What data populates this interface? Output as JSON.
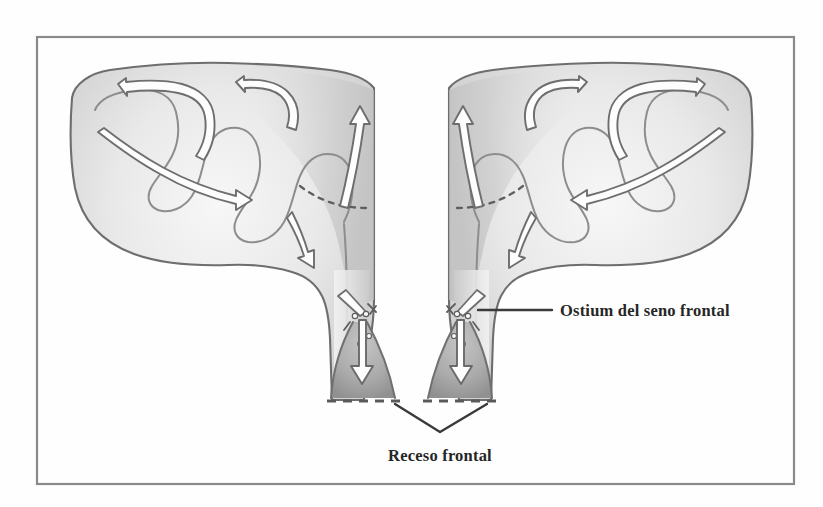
{
  "figure": {
    "kind": "anatomical-illustration",
    "style": "pencil-shaded line drawing",
    "language": "es",
    "frame": {
      "border_color": "#8a8a8a",
      "background_color": "#fefefe",
      "x": 36,
      "y": 36,
      "width": 759,
      "height": 449
    },
    "colors": {
      "outline": "#6e6e6e",
      "outline_soft": "#8d8d8d",
      "shade_light": "#ececec",
      "shade_mid": "#dcdcdc",
      "shade_dark": "#bdbdbd",
      "recess_fill": "#a9a9a9",
      "arrow_fill": "#fdfdfd",
      "text": "#262626",
      "leader": "#3a3a3a"
    },
    "labels": [
      {
        "id": "ostium",
        "text": "Ostium del seno frontal",
        "x": 560,
        "y": 316,
        "anchor": "start",
        "leader": {
          "type": "line",
          "from_x": 478,
          "from_y": 310,
          "to_x": 552,
          "to_y": 310
        }
      },
      {
        "id": "receso",
        "text": "Receso frontal",
        "x": 440,
        "y": 461,
        "anchor": "middle",
        "leader": {
          "type": "vee",
          "apex_x": 440,
          "apex_y": 432,
          "left_x": 395,
          "left_y": 404,
          "right_x": 487,
          "right_y": 404
        }
      }
    ],
    "structures": [
      {
        "id": "left-frontal-sinus",
        "side": "left",
        "description": "lobulated frontal sinus cavity with septated recesses"
      },
      {
        "id": "right-frontal-sinus",
        "side": "right",
        "description": "lobulated frontal sinus cavity with septated recesses"
      },
      {
        "id": "left-frontal-recess",
        "side": "left",
        "description": "funnel shaped frontal recess, darker shading, dashed inferior margin"
      },
      {
        "id": "right-frontal-recess",
        "side": "right",
        "description": "funnel shaped frontal recess, darker shading, dashed inferior margin"
      },
      {
        "id": "left-ostium",
        "side": "left",
        "description": "frontal sinus ostium narrowing marked by small beads"
      },
      {
        "id": "right-ostium",
        "side": "right",
        "description": "frontal sinus ostium narrowing marked by small beads"
      },
      {
        "id": "interfrontal-septum",
        "description": "midline septum separating the two sinuses"
      }
    ],
    "flow_arrows": {
      "style": "hollow outlined ribbon arrows",
      "meaning": "mucociliary transport direction",
      "count_left": 5,
      "count_right": 5,
      "terminal_direction": "inferior, through ostium into frontal recess"
    }
  }
}
